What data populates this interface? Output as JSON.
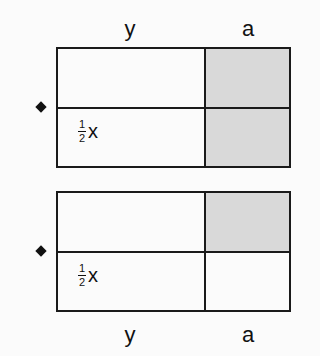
{
  "top_labels": {
    "left": "y",
    "right": "a"
  },
  "bottom_labels": {
    "left": "y",
    "right": "a"
  },
  "diagrams": [
    {
      "fraction_num": "1",
      "fraction_den": "2",
      "variable": "x",
      "shaded_cells": [
        "top-right",
        "bottom-right"
      ]
    },
    {
      "fraction_num": "1",
      "fraction_den": "2",
      "variable": "x",
      "shaded_cells": [
        "top-right"
      ]
    }
  ],
  "colors": {
    "shade": "#d9d9d9",
    "line": "#1a1a1a"
  }
}
